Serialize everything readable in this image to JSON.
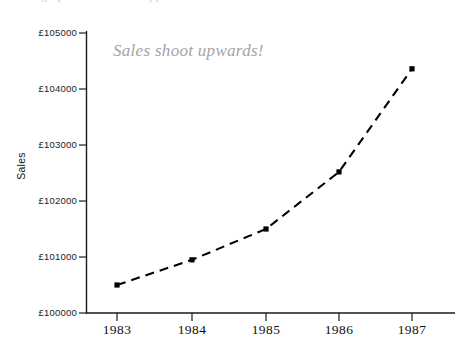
{
  "header": {
    "clipped_text_fragment": "and the graph shows what happened to sales"
  },
  "chart": {
    "annotation": "Sales shoot upwards!",
    "ylabel": "Sales",
    "xlabel": "",
    "annotation_color": "#a3a3a7",
    "line_color": "#000000",
    "marker_color": "#000000",
    "axis_color": "#1a1a1a"
  },
  "chart_data": {
    "type": "line",
    "title": "",
    "subtitle": "",
    "xlabel": "",
    "ylabel": "Sales",
    "x": [
      1983,
      1984,
      1985,
      1986,
      1987
    ],
    "categories": [
      "1983",
      "1984",
      "1985",
      "1986",
      "1987"
    ],
    "values": [
      100500,
      100950,
      101500,
      102520,
      104360
    ],
    "series": [
      {
        "name": "Sales",
        "values": [
          100500,
          100950,
          101500,
          102520,
          104360
        ]
      }
    ],
    "xlim": [
      1982.5,
      1987.5
    ],
    "ylim": [
      100000,
      105000
    ],
    "ytick_values": [
      100000,
      101000,
      102000,
      103000,
      104000,
      105000
    ],
    "ytick_labels": [
      "£100000",
      "£101000",
      "£102000",
      "£103000",
      "£104000",
      "£105000"
    ],
    "xtick_labels": [
      "1983",
      "1984",
      "1985",
      "1986",
      "1987"
    ],
    "grid": false,
    "legend": null,
    "legend_position": "none",
    "line_style": "dashed",
    "marker": "square",
    "annotations": [
      {
        "text": "Sales shoot upwards!",
        "x": 1983.6,
        "y": 104800
      }
    ]
  }
}
